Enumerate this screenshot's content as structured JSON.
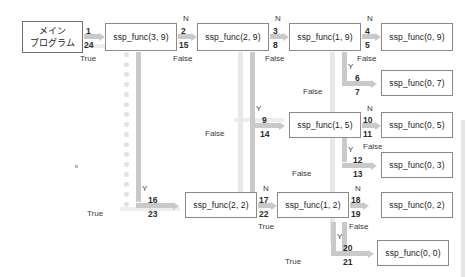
{
  "diagram": {
    "accent_color": "#c9c9c9",
    "box_border_color": "#8a8a8a",
    "background_color": "#ffffff"
  },
  "main_program": {
    "line1": "メイン",
    "line2": "プログラム"
  },
  "nodes": [
    {
      "id": "n39",
      "label": "ssp_func(3, 9)"
    },
    {
      "id": "n29",
      "label": "ssp_func(2, 9)"
    },
    {
      "id": "n19",
      "label": "ssp_func(1, 9)"
    },
    {
      "id": "n09",
      "label": "ssp_func(0, 9)"
    },
    {
      "id": "n07",
      "label": "ssp_func(0, 7)"
    },
    {
      "id": "n15",
      "label": "ssp_func(1, 5)"
    },
    {
      "id": "n05",
      "label": "ssp_func(0, 5)"
    },
    {
      "id": "n03",
      "label": "ssp_func(0, 3)"
    },
    {
      "id": "n22",
      "label": "ssp_func(2, 2)"
    },
    {
      "id": "n12",
      "label": "ssp_func(1, 2)"
    },
    {
      "id": "n02",
      "label": "ssp_func(0, 2)"
    },
    {
      "id": "n00",
      "label": "ssp_func(0, 0)"
    }
  ],
  "calls": [
    {
      "id": "c1",
      "call": "1",
      "ret": "24",
      "branch": "",
      "result": "True"
    },
    {
      "id": "c2",
      "call": "2",
      "ret": "15",
      "branch": "N",
      "result": "False"
    },
    {
      "id": "c3",
      "call": "3",
      "ret": "8",
      "branch": "N",
      "result": "False"
    },
    {
      "id": "c4",
      "call": "4",
      "ret": "5",
      "branch": "N",
      "result": "False"
    },
    {
      "id": "c6",
      "call": "6",
      "ret": "7",
      "branch": "Y",
      "result": "False"
    },
    {
      "id": "c9",
      "call": "9",
      "ret": "14",
      "branch": "Y",
      "result": "False"
    },
    {
      "id": "c10",
      "call": "10",
      "ret": "11",
      "branch": "N",
      "result": "False"
    },
    {
      "id": "c12",
      "call": "12",
      "ret": "13",
      "branch": "Y",
      "result": "False"
    },
    {
      "id": "c16",
      "call": "16",
      "ret": "23",
      "branch": "Y",
      "result": "True"
    },
    {
      "id": "c17",
      "call": "17",
      "ret": "22",
      "branch": "N",
      "result": "True"
    },
    {
      "id": "c18",
      "call": "18",
      "ret": "19",
      "branch": "N",
      "result": "False"
    },
    {
      "id": "c20",
      "call": "20",
      "ret": "21",
      "branch": "Y",
      "result": "True"
    }
  ]
}
